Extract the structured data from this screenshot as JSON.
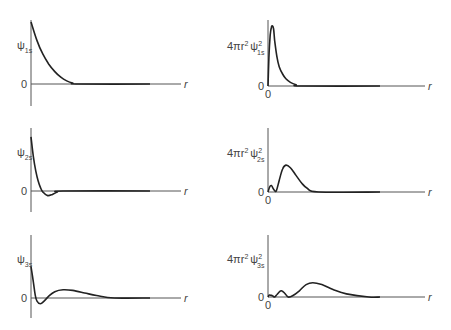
{
  "chart_data": [
    {
      "type": "line",
      "title": "",
      "ylabel": "ψ",
      "ylabel_sub": "1s",
      "xlabel": "r",
      "y_zero_label": "0",
      "x_zero_label": "",
      "ylim": [
        -0.35,
        1.0
      ],
      "xlim": [
        0,
        1.0
      ],
      "series": [
        {
          "name": "psi_1s",
          "x": [
            0,
            0.05,
            0.1,
            0.15,
            0.2,
            0.25,
            0.3,
            0.35,
            0.4,
            1.0
          ],
          "y": [
            1.0,
            0.7,
            0.48,
            0.32,
            0.2,
            0.11,
            0.05,
            0.015,
            0,
            0
          ]
        }
      ]
    },
    {
      "type": "line",
      "ylabel": "4πr² ψ",
      "ylabel_sup": "2",
      "ylabel_sub": "1s",
      "xlabel": "r",
      "y_zero_label": "0",
      "x_zero_label": "0",
      "ylim": [
        0,
        1.0
      ],
      "xlim": [
        0,
        1.0
      ],
      "series": [
        {
          "name": "rdf_1s",
          "x": [
            0,
            0.01,
            0.02,
            0.03,
            0.04,
            0.05,
            0.06,
            0.08,
            0.1,
            0.13,
            0.16,
            0.2,
            0.25,
            0.3,
            1.0
          ],
          "y": [
            0,
            0.55,
            0.85,
            0.98,
            1.0,
            0.95,
            0.75,
            0.48,
            0.32,
            0.2,
            0.12,
            0.06,
            0.02,
            0,
            0
          ]
        }
      ]
    },
    {
      "type": "line",
      "ylabel": "ψ",
      "ylabel_sub": "2s",
      "xlabel": "r",
      "y_zero_label": "0",
      "x_zero_label": "",
      "ylim": [
        -0.35,
        1.0
      ],
      "xlim": [
        0,
        1.0
      ],
      "series": [
        {
          "name": "psi_2s",
          "x": [
            0,
            0.02,
            0.04,
            0.06,
            0.08,
            0.1,
            0.14,
            0.18,
            0.22,
            0.27,
            1.0
          ],
          "y": [
            0.95,
            0.6,
            0.35,
            0.18,
            0.06,
            -0.02,
            -0.08,
            -0.06,
            -0.02,
            0,
            0
          ]
        }
      ]
    },
    {
      "type": "line",
      "ylabel": "4πr² ψ",
      "ylabel_sup": "2",
      "ylabel_sub": "2s",
      "xlabel": "r",
      "y_zero_label": "0",
      "x_zero_label": "0",
      "ylim": [
        0,
        1.0
      ],
      "xlim": [
        0,
        1.0
      ],
      "series": [
        {
          "name": "rdf_2s",
          "x": [
            0,
            0.015,
            0.03,
            0.045,
            0.06,
            0.075,
            0.1,
            0.13,
            0.16,
            0.2,
            0.25,
            0.3,
            0.35,
            0.45,
            1.0
          ],
          "y": [
            0,
            0.08,
            0.1,
            0.06,
            0.02,
            0.02,
            0.18,
            0.36,
            0.42,
            0.38,
            0.26,
            0.14,
            0.06,
            0,
            0
          ]
        }
      ]
    },
    {
      "type": "line",
      "ylabel": "ψ",
      "ylabel_sub": "3s",
      "xlabel": "r",
      "y_zero_label": "0",
      "x_zero_label": "",
      "ylim": [
        -0.35,
        1.0
      ],
      "xlim": [
        0,
        1.0
      ],
      "series": [
        {
          "name": "psi_3s",
          "x": [
            0,
            0.02,
            0.035,
            0.05,
            0.08,
            0.11,
            0.15,
            0.2,
            0.27,
            0.35,
            0.45,
            0.55,
            0.7,
            1.0
          ],
          "y": [
            0.5,
            0.25,
            0.05,
            -0.05,
            -0.09,
            -0.05,
            0.03,
            0.1,
            0.13,
            0.12,
            0.08,
            0.04,
            0,
            0
          ]
        }
      ]
    },
    {
      "type": "line",
      "ylabel": "4πr² ψ",
      "ylabel_sup": "2",
      "ylabel_sub": "3s",
      "xlabel": "r",
      "y_zero_label": "0",
      "x_zero_label": "0",
      "ylim": [
        0,
        1.0
      ],
      "xlim": [
        0,
        1.0
      ],
      "series": [
        {
          "name": "rdf_3s",
          "x": [
            0,
            0.01,
            0.02,
            0.04,
            0.06,
            0.08,
            0.1,
            0.12,
            0.15,
            0.18,
            0.22,
            0.28,
            0.34,
            0.4,
            0.48,
            0.58,
            0.7,
            0.9,
            1.0
          ],
          "y": [
            0,
            0.03,
            0.03,
            0.02,
            0,
            0.04,
            0.08,
            0.1,
            0.06,
            0,
            0.02,
            0.1,
            0.2,
            0.23,
            0.2,
            0.12,
            0.05,
            0,
            0
          ]
        }
      ]
    }
  ]
}
